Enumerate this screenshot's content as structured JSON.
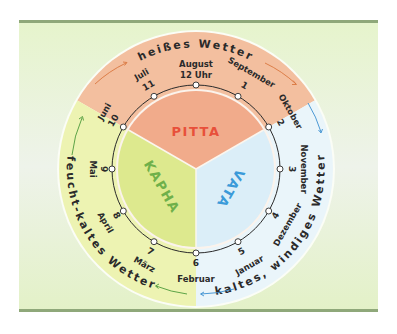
{
  "colors": {
    "frame_bar": "#8fa87a",
    "background": "#e4f2cc",
    "pitta_band": "#f3bf9f",
    "pitta_inner": "#f1ab8b",
    "pitta_text": "#e8503a",
    "kapha_band": "#edf3b2",
    "kapha_inner": "#dde98e",
    "kapha_text": "#6fb04a",
    "vata_band": "#eaf5fa",
    "vata_inner": "#dbeef8",
    "vata_text": "#3a9ad9",
    "arrow_pitta": "#d9763e",
    "arrow_kapha": "#4c9a3a",
    "arrow_vata": "#3a8fd0"
  },
  "doshas": {
    "pitta": "PITTA",
    "kapha": "KAPHA",
    "vata": "VATA"
  },
  "weather": {
    "pitta": "heißes Wetter",
    "kapha": "feucht-kaltes Wetter",
    "vata": "kaltes, windiges Wetter"
  },
  "clock": {
    "top_month": "August",
    "top_time": "12 Uhr",
    "positions": [
      {
        "num": "1",
        "month": "September"
      },
      {
        "num": "2",
        "month": "Oktober"
      },
      {
        "num": "3",
        "month": "November"
      },
      {
        "num": "4",
        "month": "Dezember"
      },
      {
        "num": "5",
        "month": "Januar"
      },
      {
        "num": "6",
        "month": "Februar"
      },
      {
        "num": "7",
        "month": "März"
      },
      {
        "num": "8",
        "month": "April"
      },
      {
        "num": "9",
        "month": "Mai"
      },
      {
        "num": "10",
        "month": "Juni"
      },
      {
        "num": "11",
        "month": "Juli"
      }
    ]
  }
}
